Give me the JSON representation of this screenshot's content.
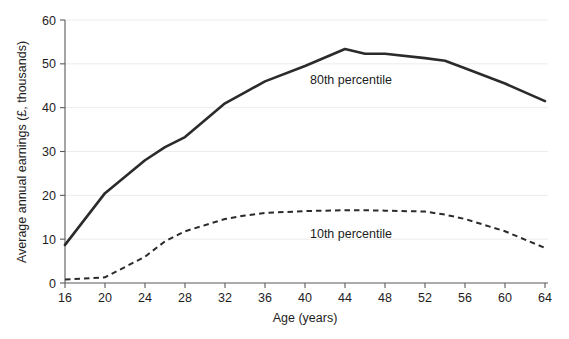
{
  "chart_data": {
    "type": "line",
    "title": "",
    "xlabel": "Age (years)",
    "ylabel": "Average annual earnings (£, thousands)",
    "xlim": [
      16,
      64
    ],
    "ylim": [
      0,
      60
    ],
    "xticks": [
      16,
      20,
      24,
      28,
      32,
      36,
      40,
      44,
      48,
      52,
      56,
      60,
      64
    ],
    "yticks": [
      0,
      10,
      20,
      30,
      40,
      50,
      60
    ],
    "xtick_labels": [
      "16",
      "20",
      "24",
      "28",
      "32",
      "36",
      "40",
      "44",
      "48",
      "52",
      "56",
      "60",
      "64"
    ],
    "ytick_labels": [
      "0",
      "10",
      "20",
      "30",
      "40",
      "50",
      "60"
    ],
    "grid": "horizontal",
    "legend_position": "inline-annotation",
    "x": [
      16,
      20,
      24,
      26,
      28,
      32,
      34,
      36,
      40,
      44,
      46,
      48,
      52,
      54,
      56,
      60,
      64
    ],
    "series": [
      {
        "name": "80th percentile",
        "style": "solid",
        "color": "#2b2b2b",
        "label_x": 44,
        "label_y": 47.5,
        "values": [
          8.7,
          20.5,
          28.0,
          31.0,
          33.3,
          41.0,
          43.5,
          46.0,
          49.5,
          53.4,
          52.3,
          52.3,
          51.3,
          50.7,
          49.0,
          45.5,
          41.5
        ]
      },
      {
        "name": "10th percentile",
        "style": "dashed",
        "color": "#2b2b2b",
        "label_x": 40,
        "label_y": 12.0,
        "values": [
          0.8,
          1.3,
          6.0,
          9.5,
          11.8,
          14.6,
          15.4,
          16.0,
          16.4,
          16.6,
          16.6,
          16.5,
          16.3,
          15.6,
          14.6,
          11.8,
          8.0
        ]
      }
    ],
    "annotations": [
      {
        "text": "80th percentile",
        "x_px": 351,
        "y_px": 84
      },
      {
        "text": "10th percentile",
        "x_px": 351,
        "y_px": 238
      }
    ]
  },
  "axes": {
    "y_axis_title": "Average annual earnings (£, thousands)",
    "x_axis_title": "Age (years)"
  }
}
